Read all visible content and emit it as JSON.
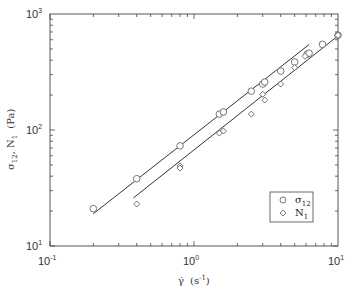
{
  "chart_data": {
    "type": "scatter",
    "title": "",
    "xlabel": "γ̇  (s⁻¹)",
    "ylabel": "σ12 , N1  (Pa)",
    "xscale": "log",
    "yscale": "log",
    "xlim": [
      0.1,
      10
    ],
    "ylim": [
      10,
      1000
    ],
    "x_tick_labels": [
      "10^-1",
      "10^0",
      "10^1"
    ],
    "y_tick_labels": [
      "10^1",
      "10^2",
      "10^3"
    ],
    "grid": false,
    "legend_position": "lower right",
    "legend": [
      "σ12",
      "N1"
    ],
    "series": [
      {
        "name": "σ12",
        "marker": "circle",
        "x": [
          0.2,
          0.4,
          0.8,
          1.5,
          1.6,
          2.5,
          3.0,
          3.1,
          4.0,
          5.0,
          6.1,
          6.3,
          7.8,
          10.0
        ],
        "y": [
          21,
          38,
          73,
          137,
          143,
          216,
          249,
          259,
          322,
          386,
          450,
          459,
          548,
          656
        ],
        "fit_line": {
          "x": [
            0.2,
            6.3
          ],
          "y": [
            19,
            545
          ]
        }
      },
      {
        "name": "N1",
        "marker": "diamond",
        "x": [
          0.4,
          0.8,
          0.8,
          1.5,
          1.6,
          2.5,
          3.0,
          3.1,
          4.0,
          5.0,
          5.9,
          10.0
        ],
        "y": [
          23,
          49,
          47,
          94,
          98,
          137,
          203,
          181,
          249,
          345,
          432,
          656
        ],
        "fit_line": {
          "x": [
            0.38,
            10.5
          ],
          "y": [
            26,
            680
          ]
        }
      }
    ]
  },
  "axes": {
    "x_label_main": "γ̇",
    "x_label_unit": "(s",
    "x_label_unit_sup": "-1",
    "x_label_unit_close": ")",
    "y_label": "σ",
    "y_label_sub": "12",
    "y_label_rest": ", N",
    "y_label_sub2": "1",
    "y_label_unit": "(Pa)",
    "x_ticks": [
      {
        "base": "10",
        "exp": "-1"
      },
      {
        "base": "10",
        "exp": "0"
      },
      {
        "base": "10",
        "exp": "1"
      }
    ],
    "y_ticks": [
      {
        "base": "10",
        "exp": "1"
      },
      {
        "base": "10",
        "exp": "2"
      },
      {
        "base": "10",
        "exp": "3"
      }
    ]
  },
  "legend": {
    "items": [
      {
        "label": "σ",
        "sub": "12"
      },
      {
        "label": "N",
        "sub": "1"
      }
    ]
  }
}
